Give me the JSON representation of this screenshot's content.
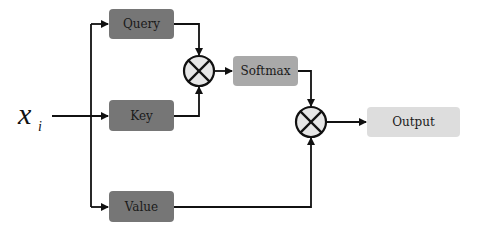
{
  "input": {
    "symbol": "x",
    "subscript": "i"
  },
  "nodes": {
    "query": {
      "label": "Query",
      "color": "#767676"
    },
    "key": {
      "label": "Key",
      "color": "#767676"
    },
    "value": {
      "label": "Value",
      "color": "#767676"
    },
    "softmax": {
      "label": "Softmax",
      "color": "#a9a9a9"
    },
    "output": {
      "label": "Output",
      "color": "#dddddd"
    }
  },
  "operators": [
    {
      "id": "multiply-qk",
      "symbol": "⊗"
    },
    {
      "id": "multiply-sv",
      "symbol": "⊗"
    }
  ],
  "colors": {
    "line": "#111111",
    "operator_fill": "#e6e6e6"
  }
}
